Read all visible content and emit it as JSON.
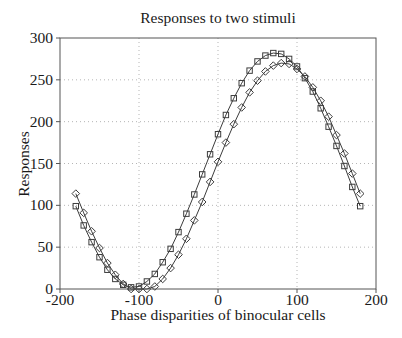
{
  "chart_data": {
    "type": "line",
    "title": "Responses to two stimuli",
    "xlabel": "Phase disparities of binocular cells",
    "ylabel": "Responses",
    "xlim": [
      -200,
      200
    ],
    "ylim": [
      0,
      300
    ],
    "xticks": [
      -200,
      -100,
      0,
      100,
      200
    ],
    "yticks": [
      0,
      50,
      100,
      150,
      200,
      250,
      300
    ],
    "grid": true,
    "grid_style": "dotted",
    "legend": "none",
    "axis_color": "#555555",
    "grid_color": "#b5b5b5",
    "text_color": "#1a1a1a",
    "line_color": "#3c3c3c",
    "x": [
      -180,
      -170,
      -160,
      -150,
      -140,
      -130,
      -120,
      -110,
      -100,
      -90,
      -80,
      -70,
      -60,
      -50,
      -40,
      -30,
      -20,
      -10,
      0,
      10,
      20,
      30,
      40,
      50,
      60,
      70,
      80,
      90,
      100,
      110,
      120,
      130,
      140,
      150,
      160,
      170,
      180
    ],
    "series": [
      {
        "name": "stimulus 1",
        "marker": "square",
        "color": "#3c3c3c",
        "values": [
          99,
          76,
          56,
          38,
          23,
          12,
          5,
          2,
          3,
          9,
          18,
          32,
          48,
          68,
          90,
          113,
          137,
          161,
          185,
          208,
          228,
          246,
          261,
          272,
          279,
          282,
          281,
          275,
          266,
          252,
          236,
          216,
          194,
          171,
          147,
          122,
          99
        ]
      },
      {
        "name": "stimulus 2",
        "marker": "diamond",
        "color": "#3c3c3c",
        "values": [
          114,
          91,
          69,
          49,
          31,
          17,
          6,
          0,
          0,
          0,
          3,
          12,
          25,
          41,
          60,
          82,
          104,
          128,
          152,
          175,
          197,
          217,
          235,
          249,
          260,
          267,
          270,
          269,
          263,
          254,
          241,
          225,
          206,
          184,
          162,
          138,
          114
        ]
      }
    ]
  }
}
